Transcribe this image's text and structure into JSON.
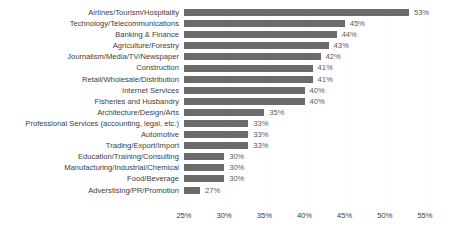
{
  "chart_data": {
    "type": "bar",
    "orientation": "horizontal",
    "title": "",
    "xlabel": "",
    "ylabel": "",
    "xlim": [
      25,
      55
    ],
    "xticks": [
      25,
      30,
      35,
      40,
      45,
      50,
      55
    ],
    "xtick_labels": [
      "25%",
      "30%",
      "35%",
      "40%",
      "45%",
      "50%",
      "55%"
    ],
    "grid": true,
    "legend": false,
    "value_label_suffix": "%",
    "bar_color": "#6b6b6b",
    "label_color": "#3d3d3d",
    "value_color": "#595959",
    "gridline_color": "#fbfbfb",
    "background": "#ffffff",
    "categories": [
      "Airlines/Tourism/Hospitality",
      "Technology/Telecommunications",
      "Banking & Finance",
      "Agriculture/Forestry",
      "Journalism/Media/TV/Newspaper",
      "Construction",
      "Retail/Wholesale/Distribution",
      "Internet Services",
      "Fisheries and Husbandry",
      "Architecture/Design/Arts",
      "Professional Services (accounting, legal, etc.)",
      "Automotive",
      "Trading/Export/Import",
      "Education/Training/Consulting",
      "Manufacturing/Industrial/Chemical",
      "Food/Beverage",
      "Adverstising/PR/Promotion"
    ],
    "values": [
      53,
      45,
      44,
      43,
      42,
      41,
      41,
      40,
      40,
      35,
      33,
      33,
      33,
      30,
      30,
      30,
      27
    ],
    "value_labels": [
      "53%",
      "45%",
      "44%",
      "43%",
      "42%",
      "41%",
      "41%",
      "40%",
      "40%",
      "35%",
      "33%",
      "33%",
      "33%",
      "30%",
      "30%",
      "30%",
      "27%"
    ]
  }
}
